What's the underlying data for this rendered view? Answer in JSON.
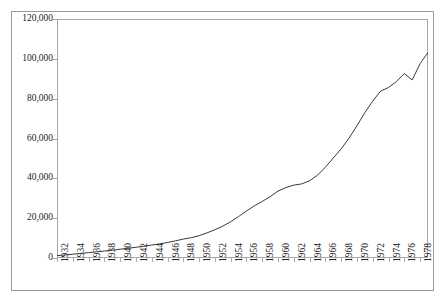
{
  "chart": {
    "type": "line",
    "title": "",
    "background_color": "#ffffff",
    "line_color": "#3a3a3a",
    "frame_color": "#a8a8a8",
    "outer_border_color": "#9a9a9a"
  },
  "chart_data": {
    "type": "line",
    "title": "",
    "subtitle": "",
    "xlabel": "",
    "ylabel": "",
    "grid": false,
    "legend": false,
    "legend_position": "none",
    "xlim": [
      1932,
      1979
    ],
    "ylim": [
      0,
      120000
    ],
    "ytick_labels": [
      "120,000",
      "100,000",
      "80,000",
      "60,000",
      "40,000",
      "20,000",
      "0"
    ],
    "ytick_values": [
      120000,
      100000,
      80000,
      60000,
      40000,
      20000,
      0
    ],
    "xtick_labels": [
      "1932",
      "1934",
      "1936",
      "1938",
      "1940",
      "1942",
      "1944",
      "1946",
      "1948",
      "1950",
      "1952",
      "1954",
      "1956",
      "1958",
      "1960",
      "1962",
      "1964",
      "1966",
      "1968",
      "1970",
      "1972",
      "1974",
      "1976",
      "1978"
    ],
    "xtick_values": [
      1932,
      1934,
      1936,
      1938,
      1940,
      1942,
      1944,
      1946,
      1948,
      1950,
      1952,
      1954,
      1956,
      1958,
      1960,
      1962,
      1964,
      1966,
      1968,
      1970,
      1972,
      1974,
      1976,
      1978
    ],
    "series": [
      {
        "name": "series-1",
        "color": "#3a3a3a",
        "x": [
          1932,
          1933,
          1934,
          1935,
          1936,
          1937,
          1938,
          1939,
          1940,
          1941,
          1942,
          1943,
          1944,
          1945,
          1946,
          1947,
          1948,
          1949,
          1950,
          1951,
          1952,
          1953,
          1954,
          1955,
          1956,
          1957,
          1958,
          1959,
          1960,
          1961,
          1962,
          1963,
          1964,
          1965,
          1966,
          1967,
          1968,
          1969,
          1970,
          1971,
          1972,
          1973,
          1974,
          1975,
          1976,
          1977,
          1978,
          1979
        ],
        "y": [
          1200,
          1500,
          1900,
          2300,
          2700,
          3100,
          3500,
          3900,
          4400,
          4900,
          5400,
          5900,
          6500,
          7100,
          7800,
          8600,
          9500,
          10200,
          11200,
          12600,
          14200,
          16000,
          18200,
          20800,
          23600,
          26200,
          28400,
          30800,
          33600,
          35400,
          36600,
          37200,
          38800,
          41600,
          45600,
          50200,
          54800,
          60200,
          66400,
          73000,
          78800,
          83800,
          85600,
          88600,
          92600,
          89400,
          97600,
          103200
        ]
      }
    ],
    "annotations": []
  }
}
